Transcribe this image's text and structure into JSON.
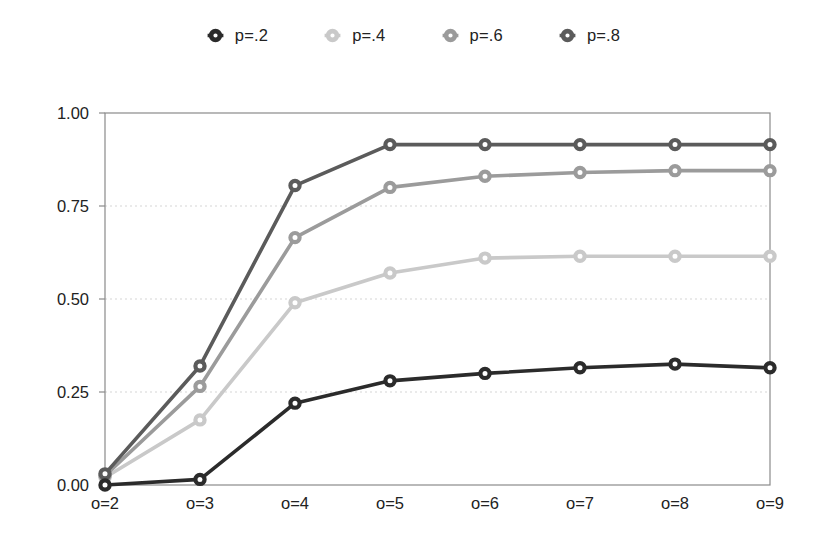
{
  "chart_data": {
    "type": "line",
    "title": "",
    "xlabel": "",
    "ylabel": "",
    "categories": [
      "o=2",
      "o=3",
      "o=4",
      "o=5",
      "o=6",
      "o=7",
      "o=8",
      "o=9"
    ],
    "ylim": [
      0,
      1
    ],
    "ytick_values": [
      0,
      0.25,
      0.5,
      0.75,
      1
    ],
    "ytick_labels": [
      "0.00",
      "0.25",
      "0.50",
      "0.75",
      "1.00"
    ],
    "grid": "horizontal-dotted",
    "legend_position": "top-center",
    "marker": "open-circle",
    "series": [
      {
        "name": "p=.2",
        "color": "#2b2b2b",
        "values": [
          0.0,
          0.015,
          0.22,
          0.28,
          0.3,
          0.315,
          0.325,
          0.315
        ]
      },
      {
        "name": "p=.4",
        "color": "#c9c9c9",
        "values": [
          0.02,
          0.175,
          0.49,
          0.57,
          0.61,
          0.615,
          0.615,
          0.615
        ]
      },
      {
        "name": "p=.6",
        "color": "#9b9b9b",
        "values": [
          0.025,
          0.265,
          0.665,
          0.8,
          0.83,
          0.84,
          0.845,
          0.845
        ]
      },
      {
        "name": "p=.8",
        "color": "#5b5b5b",
        "values": [
          0.03,
          0.32,
          0.805,
          0.915,
          0.915,
          0.915,
          0.915,
          0.915
        ]
      }
    ]
  },
  "legend": {
    "items": [
      {
        "label": "p=.2",
        "color": "#2b2b2b",
        "icon": "open-circle-marker-icon"
      },
      {
        "label": "p=.4",
        "color": "#c9c9c9",
        "icon": "open-circle-marker-icon"
      },
      {
        "label": "p=.6",
        "color": "#9b9b9b",
        "icon": "open-circle-marker-icon"
      },
      {
        "label": "p=.8",
        "color": "#5b5b5b",
        "icon": "open-circle-marker-icon"
      }
    ]
  },
  "axes": {
    "frame_color": "#8a8a8a",
    "grid_color": "#d5d5d5"
  }
}
